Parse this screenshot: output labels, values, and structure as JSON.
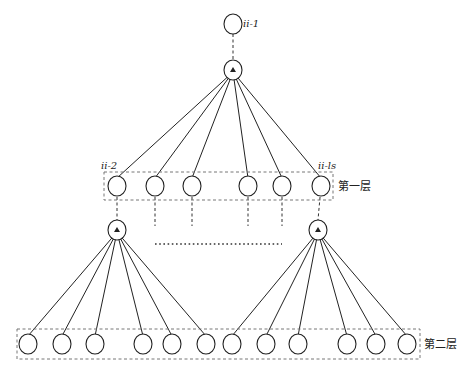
{
  "labels": {
    "root": "ii-1",
    "layer1_first": "ii-2",
    "layer1_last": "ii-ls",
    "layer1_name": "第一层",
    "layer2_name": "第二层"
  },
  "nodes": {
    "root": {
      "x": 233,
      "y": 24
    },
    "hub": {
      "x": 233,
      "y": 70
    },
    "layer1": [
      117,
      155,
      192,
      248,
      282,
      321
    ],
    "layer1_y": 186,
    "children": [
      {
        "x": 117,
        "y": 230
      },
      {
        "x": 318,
        "y": 230
      }
    ],
    "layer2_left": [
      28,
      62,
      95,
      143,
      172,
      206
    ],
    "layer2_right": [
      232,
      266,
      298,
      347,
      376,
      407
    ],
    "layer2_y": 344
  },
  "colors": {
    "stroke": "#222222",
    "box": "#777777"
  }
}
